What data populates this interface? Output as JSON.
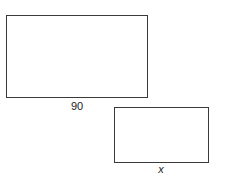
{
  "figure": {
    "large_rectangle": {
      "bottom_label": "90"
    },
    "small_rectangle": {
      "bottom_label": "x"
    },
    "stroke_color": "#3a3a3a",
    "background": "#ffffff"
  }
}
